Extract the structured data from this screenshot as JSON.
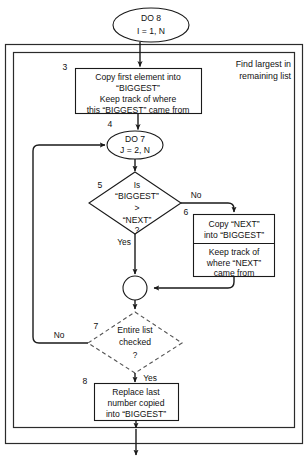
{
  "diagram": {
    "title_annotation": {
      "line1": "Find largest in",
      "line2": "remaining list"
    },
    "nodes": {
      "do8": {
        "number": "",
        "line1": "DO 8",
        "line2": "I = 1, N",
        "shape": "ellipse"
      },
      "step3": {
        "number": "3",
        "line1": "Copy first element into",
        "line2": "“BIGGEST”",
        "line3": "Keep track of where",
        "line4": "this “BIGGEST” came from",
        "shape": "process"
      },
      "do7": {
        "number": "4",
        "line1": "DO 7",
        "line2": "J = 2, N",
        "shape": "ellipse"
      },
      "decision5": {
        "number": "5",
        "line1": "Is",
        "line2": "“BIGGEST”",
        "line3": ">",
        "line4": "“NEXT”",
        "line5": "?",
        "shape": "decision"
      },
      "step6": {
        "number": "6",
        "top_line1": "Copy “NEXT”",
        "top_line2": "into “BIGGEST”",
        "bottom_line1": "Keep track of",
        "bottom_line2": "where “NEXT”",
        "bottom_line3": "came from",
        "shape": "process-split"
      },
      "merge": {
        "shape": "connector-circle"
      },
      "decision7": {
        "number": "7",
        "line1": "Entire list",
        "line2": "checked",
        "line3": "?",
        "shape": "decision-dashed"
      },
      "step8": {
        "number": "8",
        "line1": "Replace last",
        "line2": "number copied",
        "line3": "into “BIGGEST”",
        "shape": "process"
      }
    },
    "edge_labels": {
      "decision5_no": "No",
      "decision5_yes": "Yes",
      "decision7_no": "No",
      "decision7_yes": "Yes"
    },
    "colors": {
      "stroke": "#1a1a1a",
      "dashed_stroke": "#555555",
      "frame": "#2b2b2b",
      "background": "#ffffff",
      "text": "#111111"
    }
  }
}
